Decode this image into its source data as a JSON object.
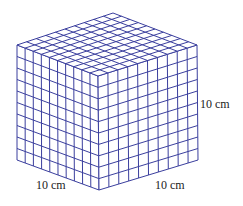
{
  "diagram": {
    "type": "cube-grid",
    "divisions": 10,
    "line_color": "#3b3f9e",
    "vertices": {
      "top": [
        113,
        13
      ],
      "left_top": [
        17,
        45
      ],
      "right_top": [
        197,
        45
      ],
      "front_top": [
        98,
        76
      ],
      "left_bottom": [
        17,
        160
      ],
      "right_bottom": [
        198,
        160
      ],
      "front_bottom": [
        99,
        190
      ]
    },
    "labels": {
      "height": "10 cm",
      "left_width": "10 cm",
      "right_width": "10 cm"
    }
  }
}
